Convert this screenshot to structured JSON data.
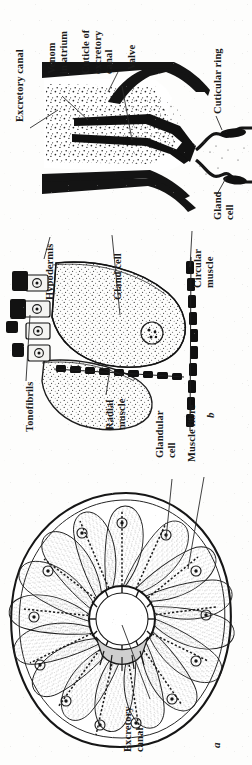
{
  "figure": {
    "orientation": "page rotated 90 degrees; all label text reads bottom-to-top",
    "ink_color": "#1a1a1a",
    "paper_color": "#fdfdfc"
  },
  "panels": [
    {
      "id": "c",
      "letter": "",
      "name": "longitudinal-section-of-valve-and-canal",
      "labels": [
        {
          "key": "excretory_canal",
          "text": "Excretory canal"
        },
        {
          "key": "venom_in_atrium",
          "text": "Venom\nin atrium"
        },
        {
          "key": "cuticle_of_excretory_canal",
          "text": "Cuticle of\nexcretory\ncanal"
        },
        {
          "key": "valve",
          "text": "Valve"
        },
        {
          "key": "cuticular_ring",
          "text": "Cuticular ring"
        },
        {
          "key": "gland_cell",
          "text": "Gland\ncell"
        }
      ]
    },
    {
      "id": "b",
      "letter": "b",
      "name": "gland-cell-and-hypodermis-section",
      "labels": [
        {
          "key": "hypodermis",
          "text": "Hypodermis"
        },
        {
          "key": "gland_cell",
          "text": "Gland cell"
        },
        {
          "key": "tonofibrils",
          "text": "Tonofibrils"
        },
        {
          "key": "radial_muscle",
          "text": "Radial\nmuscle"
        },
        {
          "key": "circular_muscle",
          "text": "Circular\nmuscle"
        }
      ]
    },
    {
      "id": "a",
      "letter": "a",
      "name": "transverse-section-radial-arrangement",
      "labels": [
        {
          "key": "glandular_cell",
          "text": "Glandular\ncell"
        },
        {
          "key": "muscle_fibre",
          "text": "Muscle fibre"
        },
        {
          "key": "excretory_canal",
          "text": "Excretory\ncanal"
        }
      ]
    }
  ]
}
